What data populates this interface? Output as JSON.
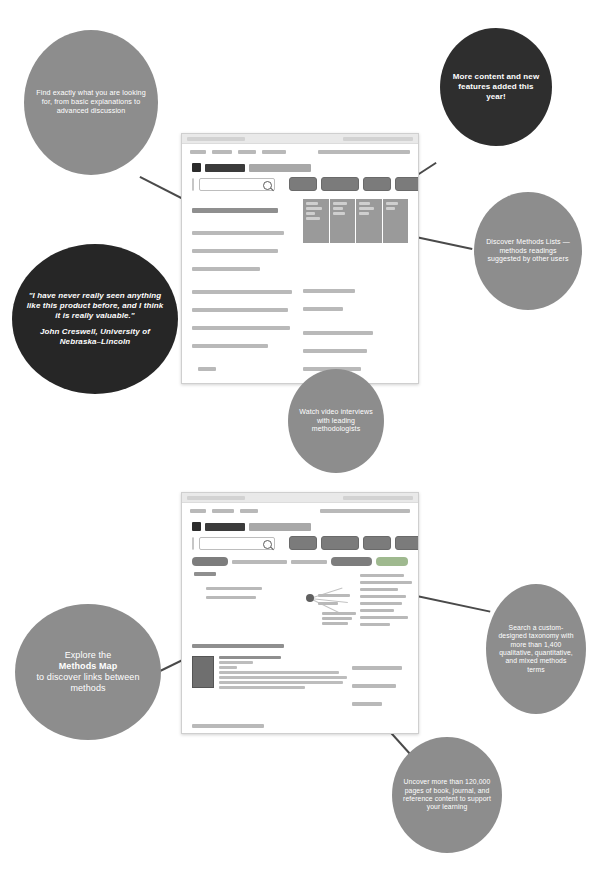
{
  "page": {
    "background_color": "#ffffff"
  },
  "colors": {
    "bubble_gray": "#8d8d8d",
    "bubble_dark": "#2e2e2e",
    "bubble_quote": "#262626",
    "leader_line": "#4a4a4a",
    "bubble_text": "#ffffff"
  },
  "sections": [
    {
      "id": "section-top",
      "screenshot": {
        "name": "sage-research-methods-homepage",
        "brand_mark": "SAGE",
        "brand_word": "research methods",
        "search_placeholder": "Search",
        "search_button_label": "Search",
        "nav_buttons": [
          "Browse",
          "Methods Map",
          "Cases",
          "Video",
          "More"
        ],
        "panel_headings": [
          "Books",
          "Journals",
          "Reference",
          "Video"
        ],
        "promo_heading": "SAGE Research Methods Online",
        "videos_heading": "Recently published and popular video research",
        "footer_label": "SAGE"
      },
      "callouts": [
        {
          "id": "callout-find-exactly",
          "style": "gray",
          "text": "Find exactly what you are looking for, from basic explanations to advanced discussion"
        },
        {
          "id": "callout-more-content",
          "style": "dark",
          "text": "More content and new features added this year!"
        },
        {
          "id": "callout-methods-lists",
          "style": "gray",
          "text": "Discover Methods Lists — methods readings suggested by other users"
        },
        {
          "id": "callout-watch-video",
          "style": "gray",
          "text": "Watch video interviews with leading methodologists"
        }
      ],
      "quote": {
        "id": "callout-testimonial",
        "style": "quote",
        "text": "\"I have never really seen anything like this product before, and I think it is really valuable.\"",
        "attribution": "John Creswell, University of Nebraska–Lincoln"
      }
    },
    {
      "id": "section-bottom",
      "screenshot": {
        "name": "sage-research-methods-methods-map",
        "brand_mark": "SAGE",
        "brand_word": "research methods",
        "search_placeholder": "Search",
        "search_button_label": "Search",
        "nav_buttons": [
          "Browse",
          "Methods Map",
          "Cases",
          "Video",
          "More"
        ],
        "breadcrumb_label": "Methods Map",
        "map_heading": "Methods",
        "results_heading": "Search results",
        "result_title": "Qualitative Media Analysis",
        "footer_label": "SAGE"
      },
      "callouts": [
        {
          "id": "callout-methods-map",
          "style": "gray",
          "line1": "Explore the",
          "line2": "Methods Map",
          "line3": "to discover links between methods"
        },
        {
          "id": "callout-taxonomy",
          "style": "gray",
          "text": "Search a custom-designed taxonomy with more than 1,400 qualitative, quantitative, and mixed methods terms"
        },
        {
          "id": "callout-uncover-pages",
          "style": "gray",
          "text": "Uncover more than 120,000 pages of book, journal, and reference content to support your learning"
        }
      ]
    }
  ]
}
